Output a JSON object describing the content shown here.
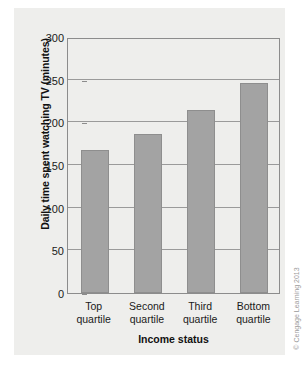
{
  "chart_data": {
    "type": "bar",
    "title": "",
    "categories": [
      "Top quartile",
      "Second quartile",
      "Third quartile",
      "Bottom quartile"
    ],
    "category_lines": [
      [
        "Top",
        "quartile"
      ],
      [
        "Second",
        "quartile"
      ],
      [
        "Third",
        "quartile"
      ],
      [
        "Bottom",
        "quartile"
      ]
    ],
    "values": [
      168,
      186,
      215,
      246
    ],
    "xlabel": "Income status",
    "ylabel": "Daily time spent watching TV (minutes)",
    "ylim": [
      0,
      300
    ],
    "yticks": [
      0,
      50,
      100,
      150,
      200,
      250,
      300
    ],
    "ytick_labels": [
      "0",
      "50",
      "100",
      "150",
      "200",
      "250",
      "300"
    ],
    "grid": "horizontal",
    "legend": "none",
    "bar_color": "#a3a3a3",
    "bar_edge_color": "#8e8e8e",
    "panel_color": "#eeeeec",
    "axis_color": "#8c8c8c",
    "gridline_color": "#9a9a9a"
  },
  "credit": {
    "text": "© Cengage Learning 2013"
  }
}
